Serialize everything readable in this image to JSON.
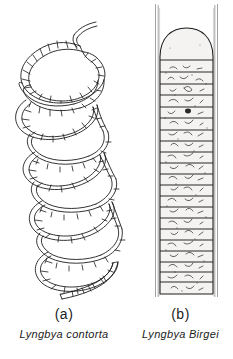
{
  "plate": {
    "background_color": "#ffffff",
    "ink_color": "#1c1c1c",
    "sheath_color": "#6f6f6f",
    "cell_fill_color": "#f2f2f0"
  },
  "figures": [
    {
      "key": "a",
      "letter": "(a)",
      "species": "Lyngbya contorta",
      "form": "helical-coiled-filament",
      "coil_count": 5,
      "visible_septa": true,
      "sheath_visible": false,
      "apex": "tapered-free-end-upper-right",
      "base": "blunt-end-lower-right"
    },
    {
      "key": "b",
      "letter": "(b)",
      "species": "Lyngbya Birgei",
      "form": "straight-cylindrical-filament",
      "cell_count": 23,
      "visible_septa": true,
      "sheath_visible": true,
      "sheath_extends_beyond_trichome": true,
      "apex": "rounded-apical-cell",
      "base": "flat-truncate-end",
      "cell_contents": "granular"
    }
  ],
  "captions": {
    "a": {
      "letter": "(a)",
      "name": "Lyngbya contorta"
    },
    "b": {
      "letter": "(b)",
      "name": "Lyngbya Birgei"
    }
  }
}
